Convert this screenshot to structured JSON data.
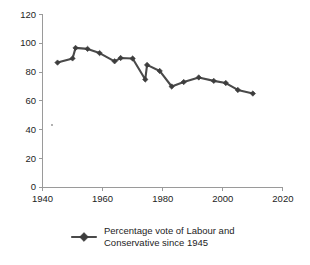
{
  "chart_data": {
    "type": "line",
    "title": "",
    "subtitle": "",
    "xlabel": "",
    "ylabel": "",
    "xlim": [
      1940,
      2020
    ],
    "ylim": [
      0,
      120
    ],
    "grid": false,
    "legend_position": "bottom",
    "x_ticks": [
      "1940",
      "1960",
      "1980",
      "2000",
      "2020"
    ],
    "y_ticks": [
      "0",
      "20",
      "40",
      "60",
      "80",
      "100",
      "120"
    ],
    "series": [
      {
        "name": "Percentage vote of Labour and Conservative since 1945",
        "marker": "diamond",
        "color": "#4a4a4a",
        "x": [
          1945,
          1950,
          1951,
          1955,
          1959,
          1964,
          1966,
          1970,
          1974.2,
          1974.8,
          1979,
          1983,
          1987,
          1992,
          1997,
          2001,
          2005,
          2010
        ],
        "values": [
          86.6,
          89.5,
          96.8,
          96.1,
          93.2,
          87.5,
          89.8,
          89.4,
          74.9,
          85.0,
          80.8,
          70.0,
          73.1,
          76.3,
          73.9,
          72.4,
          67.6,
          65.1
        ]
      }
    ],
    "legend": [
      {
        "label_line1": "Percentage vote of Labour and",
        "label_line2": "Conservative since 1945",
        "marker": "diamond",
        "color": "#4a4a4a"
      }
    ],
    "colors": {
      "series": "#4a4a4a",
      "marker": "#3d3d3d",
      "axis": "#9a9a9a",
      "text": "#1d1d1d",
      "background": "#ffffff"
    }
  }
}
